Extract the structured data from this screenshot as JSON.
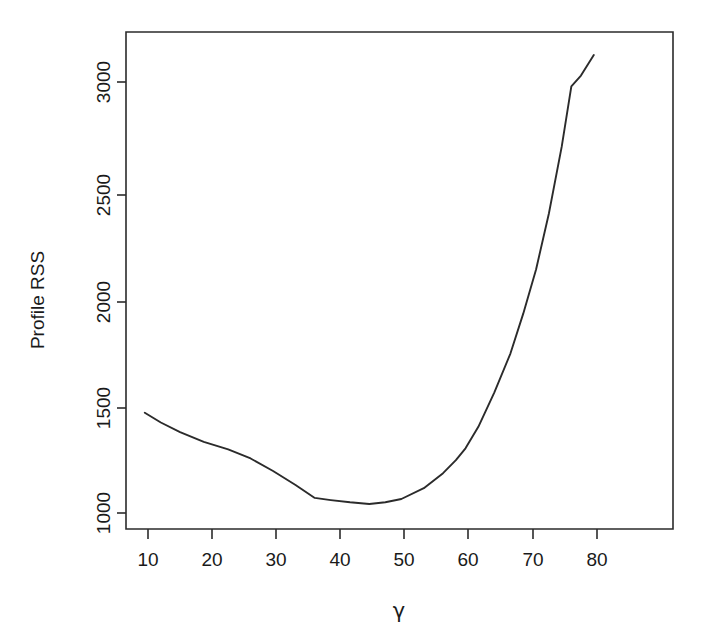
{
  "chart_data": {
    "type": "line",
    "title": "",
    "subtitle": "",
    "xlabel": "γ",
    "ylabel": "Profile RSS",
    "xlim": [
      5.5,
      82.0
    ],
    "ylim": [
      940,
      3200
    ],
    "xticks": [
      10,
      20,
      30,
      40,
      50,
      60,
      70,
      80
    ],
    "xticklabels": [
      "10",
      "20",
      "30",
      "40",
      "50",
      "60",
      "70",
      "80"
    ],
    "yticks": [
      1000,
      1500,
      2000,
      2500,
      3000
    ],
    "yticklabels": [
      "1000",
      "1500",
      "2000",
      "2500",
      "3000"
    ],
    "grid": false,
    "legend": null,
    "annotations": [],
    "line_color": "#2b2b2b",
    "background_color": "#ffffff",
    "series": [
      {
        "name": "Profile RSS",
        "x": [
          9.5,
          12.0,
          15.0,
          18.7,
          22.5,
          26.0,
          29.5,
          33.0,
          36.0,
          38.5,
          41.5,
          44.5,
          47.0,
          49.5,
          53.0,
          56.0,
          58.0,
          59.5,
          61.5,
          64.0,
          66.5,
          68.5,
          70.5,
          72.5,
          74.5,
          76.0,
          77.5,
          79.5
        ],
        "y": [
          1465,
          1420,
          1375,
          1330,
          1295,
          1253,
          1195,
          1130,
          1070,
          1060,
          1050,
          1042,
          1050,
          1065,
          1115,
          1185,
          1245,
          1300,
          1400,
          1560,
          1740,
          1925,
          2130,
          2390,
          2700,
          2980,
          3030,
          3125
        ]
      }
    ]
  },
  "axis": {
    "ylabel": "Profile RSS",
    "xlabel": "γ"
  }
}
